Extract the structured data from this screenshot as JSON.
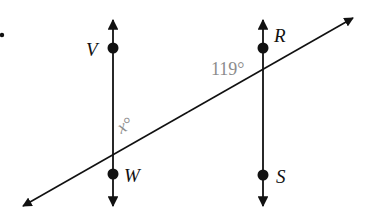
{
  "diagram": {
    "colors": {
      "line": "#111111",
      "angle_label": "#8c8c8c",
      "background": "#ffffff"
    },
    "lines": {
      "left_vertical": {
        "name": "line VW",
        "x": 113,
        "y_top": 18,
        "y_bottom": 208
      },
      "right_vertical": {
        "name": "line RS",
        "x": 263,
        "y_top": 18,
        "y_bottom": 208
      },
      "transversal": {
        "x1": 21,
        "y1": 207,
        "x2": 355,
        "y2": 17
      }
    },
    "points": [
      {
        "label": "V",
        "x": 113,
        "y": 48,
        "label_x": 86,
        "label_y": 56
      },
      {
        "label": "W",
        "x": 113,
        "y": 174,
        "label_x": 124,
        "label_y": 182
      },
      {
        "label": "R",
        "x": 263,
        "y": 48,
        "label_x": 274,
        "label_y": 42
      },
      {
        "label": "S",
        "x": 263,
        "y": 175,
        "label_x": 276,
        "label_y": 183
      }
    ],
    "angles": [
      {
        "id": "given",
        "value": "119°",
        "x": 212,
        "y": 75
      },
      {
        "id": "unknown",
        "variable": "x",
        "degree": "°",
        "x": 122,
        "y": 133
      }
    ],
    "stray_mark": {
      "x": 2,
      "y": 35
    }
  }
}
